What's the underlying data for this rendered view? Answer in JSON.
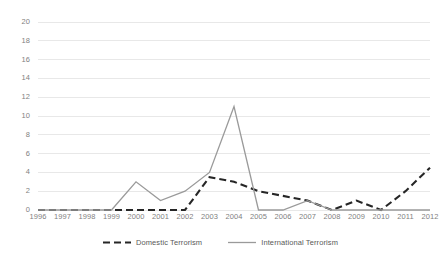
{
  "chart_data": {
    "type": "line",
    "title": "",
    "xlabel": "",
    "ylabel": "",
    "x": [
      1996,
      1997,
      1998,
      1999,
      2000,
      2001,
      2002,
      2003,
      2004,
      2005,
      2006,
      2007,
      2008,
      2009,
      2010,
      2011,
      2012
    ],
    "categories": [
      "1996",
      "1997",
      "1998",
      "1999",
      "2000",
      "2001",
      "2002",
      "2003",
      "2004",
      "2005",
      "2006",
      "2007",
      "2008",
      "2009",
      "2010",
      "2011",
      "2012"
    ],
    "series": [
      {
        "name": "Domestic Terrorism",
        "style": "dashed",
        "color": "#262626",
        "values": [
          0,
          0,
          0,
          0,
          0,
          0,
          0,
          3.5,
          3,
          2,
          1.5,
          1,
          0,
          1,
          0,
          2,
          4.5
        ]
      },
      {
        "name": "International Terrorism",
        "style": "solid",
        "color": "#9a9a9a",
        "values": [
          0,
          0,
          0,
          0,
          3,
          1,
          2,
          4,
          11,
          0,
          0,
          1,
          0,
          0,
          0,
          0,
          0
        ]
      }
    ],
    "ylim": [
      0,
      20
    ],
    "y_ticks": [
      "0",
      "2",
      "4",
      "6",
      "8",
      "10",
      "12",
      "14",
      "16",
      "18",
      "20"
    ],
    "grid": true,
    "grid_axis": "y",
    "legend_position": "bottom",
    "colors": {
      "domestic": "#262626",
      "international": "#9a9a9a",
      "gridline": "#e8e8e8",
      "axis_text": "#7f7f7f",
      "legend_text": "#595959"
    }
  }
}
